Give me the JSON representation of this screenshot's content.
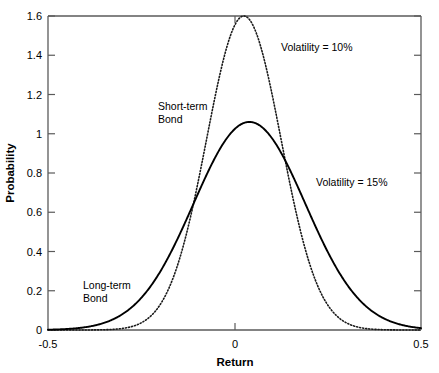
{
  "chart_data": {
    "type": "line",
    "title": "",
    "xlabel": "Return",
    "ylabel": "Probability",
    "xlim": [
      -0.5,
      0.5
    ],
    "ylim": [
      0,
      1.6
    ],
    "grid": false,
    "legend_position": "inline-annotations",
    "x_ticks": [
      -0.5,
      0,
      0.5
    ],
    "x_tick_labels": [
      "-0.5",
      "0",
      "0.5"
    ],
    "y_ticks": [
      0,
      0.2,
      0.4,
      0.6,
      0.8,
      1.0,
      1.2,
      1.4,
      1.6
    ],
    "y_tick_labels": [
      "0",
      "0.2",
      "0.4",
      "0.6",
      "0.8",
      "1",
      "1.2",
      "1.4",
      "1.6"
    ],
    "series": [
      {
        "name": "Short-term Bond",
        "annotation": "Volatility = 10%",
        "style": "dotted",
        "color": "#1a1a1a",
        "distribution": "normal",
        "mean": 0.025,
        "sigma": 0.1,
        "peak": 1.6,
        "x": [
          -0.5,
          -0.45,
          -0.4,
          -0.35,
          -0.3,
          -0.25,
          -0.2,
          -0.15,
          -0.1,
          -0.05,
          0.0,
          0.025,
          0.05,
          0.1,
          0.15,
          0.2,
          0.25,
          0.3,
          0.35,
          0.4,
          0.45,
          0.5
        ],
        "y": [
          0.0,
          0.0,
          0.0,
          0.0,
          0.01,
          0.04,
          0.14,
          0.38,
          0.77,
          1.22,
          1.56,
          1.6,
          1.56,
          1.22,
          0.77,
          0.38,
          0.14,
          0.04,
          0.01,
          0.0,
          0.0,
          0.0
        ]
      },
      {
        "name": "Long-term Bond",
        "annotation": "Volatility = 15%",
        "style": "solid",
        "color": "#000000",
        "distribution": "normal",
        "mean": 0.04,
        "sigma": 0.15,
        "peak": 1.06,
        "x": [
          -0.5,
          -0.45,
          -0.4,
          -0.35,
          -0.3,
          -0.25,
          -0.2,
          -0.15,
          -0.1,
          -0.05,
          0.0,
          0.04,
          0.05,
          0.1,
          0.15,
          0.2,
          0.25,
          0.3,
          0.35,
          0.4,
          0.45,
          0.5
        ],
        "y": [
          0.01,
          0.02,
          0.03,
          0.06,
          0.11,
          0.19,
          0.31,
          0.47,
          0.65,
          0.83,
          0.99,
          1.06,
          1.05,
          0.99,
          0.83,
          0.65,
          0.47,
          0.31,
          0.19,
          0.11,
          0.06,
          0.03
        ]
      }
    ],
    "annotations": [
      {
        "text": "Volatility = 10%",
        "x": 0.115,
        "y": 1.43
      },
      {
        "text": "Volatility = 15%",
        "x": 0.225,
        "y": 0.72
      },
      {
        "text_line1": "Short-term",
        "text_line2": "Bond",
        "x": -0.155,
        "y": 1.13
      },
      {
        "text_line1": "Long-term",
        "text_line2": "Bond",
        "x": -0.375,
        "y": 0.22
      }
    ]
  },
  "axes": {
    "x_label": "Return",
    "y_label": "Probability",
    "x_tick_labels": [
      "-0.5",
      "0",
      "0.5"
    ],
    "y_tick_labels": [
      "1.6",
      "1.4",
      "1.2",
      "1",
      "0.8",
      "0.6",
      "0.4",
      "0.2",
      "0"
    ]
  },
  "labels": {
    "vol10": "Volatility = 10%",
    "vol15": "Volatility = 15%",
    "short_term_1": "Short-term",
    "short_term_2": "Bond",
    "long_term_1": "Long-term",
    "long_term_2": "Bond"
  },
  "colors": {
    "frame": "#5a5a5a",
    "curve_solid": "#000000",
    "curve_dotted": "#1a1a1a",
    "background": "#ffffff"
  }
}
